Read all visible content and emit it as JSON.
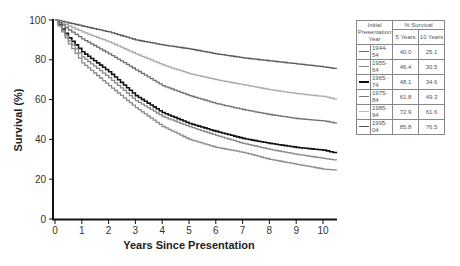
{
  "chart_data": {
    "type": "line",
    "title": "",
    "xlabel": "Years Since Presentation",
    "ylabel": "Survival (%)",
    "xlim": [
      0,
      10.5
    ],
    "ylim": [
      0,
      100
    ],
    "xticks": [
      0,
      1,
      2,
      3,
      4,
      5,
      6,
      7,
      8,
      9,
      10
    ],
    "yticks": [
      0,
      20,
      40,
      60,
      80,
      100
    ],
    "grid": false,
    "legend_position": "right (table)",
    "x": [
      0,
      0.5,
      1,
      2,
      3,
      4,
      5,
      6,
      7,
      8,
      9,
      10,
      10.5
    ],
    "series": [
      {
        "name": "1995-04",
        "color": "#555555",
        "width": 1.3,
        "five_year": 85.8,
        "ten_year": 76.5,
        "values": [
          100,
          98.5,
          97,
          94,
          90,
          87.5,
          85.5,
          83,
          81,
          79.5,
          78,
          76.5,
          75.5
        ]
      },
      {
        "name": "1985-94",
        "color": "#aaaaaa",
        "width": 1.3,
        "five_year": 72.9,
        "ten_year": 61.6,
        "values": [
          100,
          97,
          94,
          89,
          83,
          77.5,
          73,
          70,
          67.5,
          65,
          63,
          61.6,
          60
        ]
      },
      {
        "name": "1975-84",
        "color": "#707070",
        "width": 1.3,
        "five_year": 61.8,
        "ten_year": 49.3,
        "values": [
          100,
          95,
          90.5,
          83,
          75,
          67,
          62,
          58,
          55,
          52.5,
          50.5,
          49.3,
          48
        ]
      },
      {
        "name": "1965-74",
        "color": "#111111",
        "width": 1.6,
        "five_year": 48.1,
        "ten_year": 34.6,
        "values": [
          100,
          91,
          84,
          74,
          62,
          53.5,
          48,
          44,
          40.5,
          38,
          36,
          34.6,
          33
        ]
      },
      {
        "name": "1955-64",
        "color": "#888888",
        "width": 1.3,
        "five_year": 46.4,
        "ten_year": 30.5,
        "values": [
          100,
          89.5,
          81.5,
          71,
          59.5,
          51.5,
          46.4,
          42,
          38,
          35,
          32.5,
          30.5,
          29.5
        ]
      },
      {
        "name": "1944-54",
        "color": "#8a8a8a",
        "width": 1.3,
        "five_year": 40.0,
        "ten_year": 25.1,
        "values": [
          100,
          88,
          78.5,
          67,
          56,
          46.5,
          40,
          36,
          33.5,
          30,
          27.5,
          25.1,
          24.5
        ]
      }
    ]
  },
  "legend": {
    "header_col1": "Initial Presentation Year",
    "header_col2": "% Survival",
    "sub_5": "5 Years",
    "sub_10": "10 Years",
    "rows": [
      {
        "year": "1944-54",
        "five": "40.0",
        "ten": "25.1",
        "color": "#666666",
        "width": 1.3
      },
      {
        "year": "1955-64",
        "five": "46.4",
        "ten": "30.5",
        "color": "#888888",
        "width": 1.3
      },
      {
        "year": "1965-74",
        "five": "48.1",
        "ten": "34.6",
        "color": "#111111",
        "width": 2
      },
      {
        "year": "1975-84",
        "five": "61.8",
        "ten": "49.3",
        "color": "#777777",
        "width": 1.3
      },
      {
        "year": "1985-94",
        "five": "72.9",
        "ten": "61.6",
        "color": "#bbbbbb",
        "width": 1.3
      },
      {
        "year": "1995-04",
        "five": "85.8",
        "ten": "76.5",
        "color": "#555555",
        "width": 1.5
      }
    ]
  }
}
